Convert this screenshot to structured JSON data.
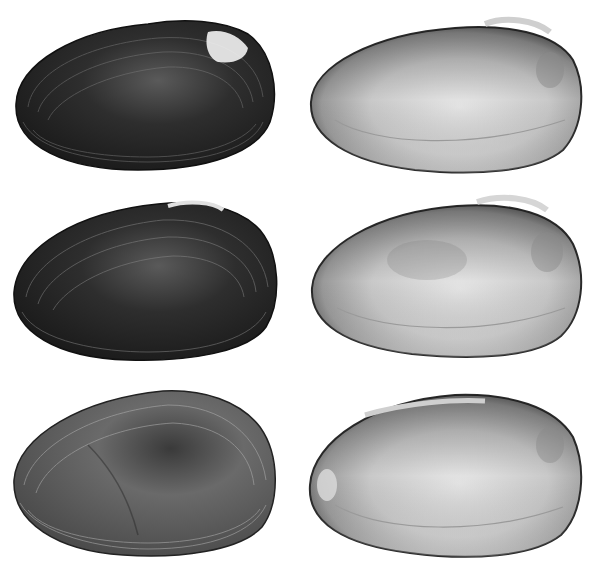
{
  "figure": {
    "background": "#ffffff",
    "rows": [
      {
        "exterior": {
          "view": "exterior",
          "tone": "dark"
        },
        "interior": {
          "view": "interior",
          "tone": "nacre"
        }
      },
      {
        "exterior": {
          "view": "exterior",
          "tone": "dark"
        },
        "interior": {
          "view": "interior",
          "tone": "nacre"
        }
      },
      {
        "exterior": {
          "view": "exterior",
          "tone": "medium"
        },
        "interior": {
          "view": "interior",
          "tone": "nacre"
        }
      }
    ]
  }
}
